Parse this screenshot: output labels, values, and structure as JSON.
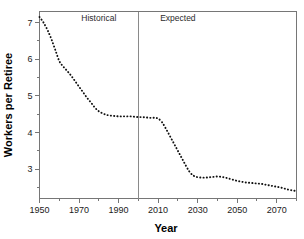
{
  "chart_data": {
    "type": "line",
    "title": "",
    "xlabel": "Year",
    "ylabel": "Workers per Retiree",
    "xlim": [
      1950,
      2080
    ],
    "ylim": [
      2.2,
      7.3
    ],
    "grid": false,
    "legend": "none",
    "line_style": "dotted",
    "xticks": [
      1950,
      1970,
      1990,
      2010,
      2030,
      2050,
      2070
    ],
    "xtick_labels": [
      "1950",
      "1970",
      "1990",
      "2010",
      "2030",
      "2050",
      "2070"
    ],
    "xminor_ticks": [
      1960,
      1980,
      2000,
      2020,
      2040,
      2060,
      2080
    ],
    "yticks": [
      3,
      4,
      5,
      6,
      7
    ],
    "ytick_labels": [
      "3",
      "4",
      "5",
      "6",
      "7"
    ],
    "yminor_ticks": [
      2.5,
      3.5,
      4.5,
      5.5,
      6.5
    ],
    "annotations": [
      {
        "text": "Historical",
        "x": 1980,
        "y": 7.05
      },
      {
        "text": "Expected",
        "x": 2020,
        "y": 7.05
      }
    ],
    "vertical_divider": {
      "x": 2000,
      "label": "historical-expected-boundary"
    },
    "series": [
      {
        "name": "Workers per Retiree",
        "color": "#111111",
        "x": [
          1950,
          1952,
          1954,
          1956,
          1958,
          1960,
          1962,
          1964,
          1966,
          1968,
          1970,
          1972,
          1974,
          1976,
          1978,
          1980,
          1982,
          1984,
          1986,
          1988,
          1990,
          1992,
          1994,
          1996,
          1998,
          2000,
          2002,
          2004,
          2006,
          2008,
          2010,
          2012,
          2014,
          2016,
          2018,
          2020,
          2022,
          2024,
          2026,
          2028,
          2030,
          2032,
          2034,
          2036,
          2038,
          2040,
          2042,
          2044,
          2046,
          2048,
          2050,
          2052,
          2054,
          2056,
          2058,
          2060,
          2062,
          2064,
          2066,
          2068,
          2070,
          2072,
          2074,
          2076,
          2078,
          2080
        ],
        "y": [
          7.15,
          7.0,
          6.8,
          6.55,
          6.25,
          5.95,
          5.8,
          5.68,
          5.55,
          5.4,
          5.25,
          5.1,
          4.95,
          4.82,
          4.68,
          4.58,
          4.52,
          4.48,
          4.46,
          4.45,
          4.44,
          4.44,
          4.44,
          4.44,
          4.43,
          4.42,
          4.42,
          4.41,
          4.4,
          4.4,
          4.38,
          4.28,
          4.1,
          3.9,
          3.7,
          3.5,
          3.3,
          3.1,
          2.92,
          2.82,
          2.78,
          2.77,
          2.77,
          2.78,
          2.79,
          2.8,
          2.79,
          2.77,
          2.74,
          2.71,
          2.68,
          2.66,
          2.64,
          2.63,
          2.62,
          2.61,
          2.6,
          2.58,
          2.56,
          2.54,
          2.52,
          2.5,
          2.47,
          2.44,
          2.42,
          2.4
        ]
      }
    ]
  }
}
